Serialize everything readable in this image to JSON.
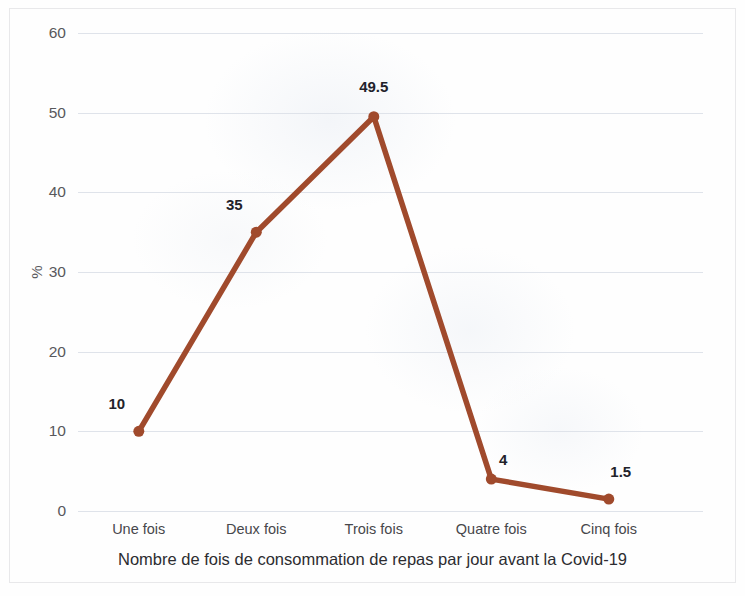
{
  "chart_data": {
    "type": "line",
    "title": "",
    "xlabel": "Nombre de fois de consommation de repas par jour avant la Covid-19",
    "ylabel": "%",
    "categories": [
      "Une fois",
      "Deux fois",
      "Trois fois",
      "Quatre fois",
      "Cinq fois"
    ],
    "values": [
      10,
      35,
      49.5,
      4,
      1.5
    ],
    "point_labels": [
      "10",
      "35",
      "49.5",
      "4",
      "1.5"
    ],
    "ylim": [
      0,
      60
    ],
    "yticks": [
      0,
      10,
      20,
      30,
      40,
      50,
      60
    ],
    "ytick_labels": [
      "0",
      "10",
      "20",
      "30",
      "40",
      "50",
      "60"
    ],
    "grid": true,
    "legend": "none",
    "series_color": "#a04a2c",
    "marker": "circle",
    "gridline_color": "#dfe3ea"
  },
  "axis": {
    "y_title": "%",
    "x_title": "Nombre de fois de consommation de repas par jour avant la Covid-19"
  }
}
